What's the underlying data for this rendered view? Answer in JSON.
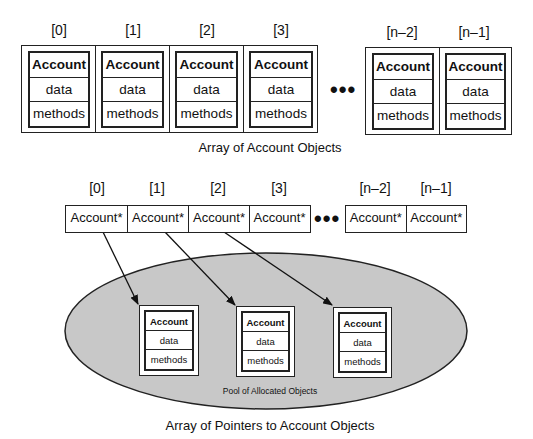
{
  "top_array": {
    "indices": [
      "[0]",
      "[1]",
      "[2]",
      "[3]",
      "[n–2]",
      "[n–1]"
    ],
    "object": {
      "header": "Account",
      "data": "data",
      "methods": "methods"
    },
    "ellipsis": "•••",
    "caption": "Array of Account Objects"
  },
  "pointer_array": {
    "indices": [
      "[0]",
      "[1]",
      "[2]",
      "[3]",
      "[n–2]",
      "[n–1]"
    ],
    "cell_label": "Account*",
    "ellipsis": "•••",
    "caption": "Array of Pointers to Account Objects"
  },
  "pool": {
    "label": "Pool of Allocated Objects",
    "fill_color": "#c8c8c8",
    "objects": [
      {
        "header": "Account",
        "data": "data",
        "methods": "methods"
      },
      {
        "header": "Account",
        "data": "data",
        "methods": "methods"
      },
      {
        "header": "Account",
        "data": "data",
        "methods": "methods"
      }
    ]
  }
}
